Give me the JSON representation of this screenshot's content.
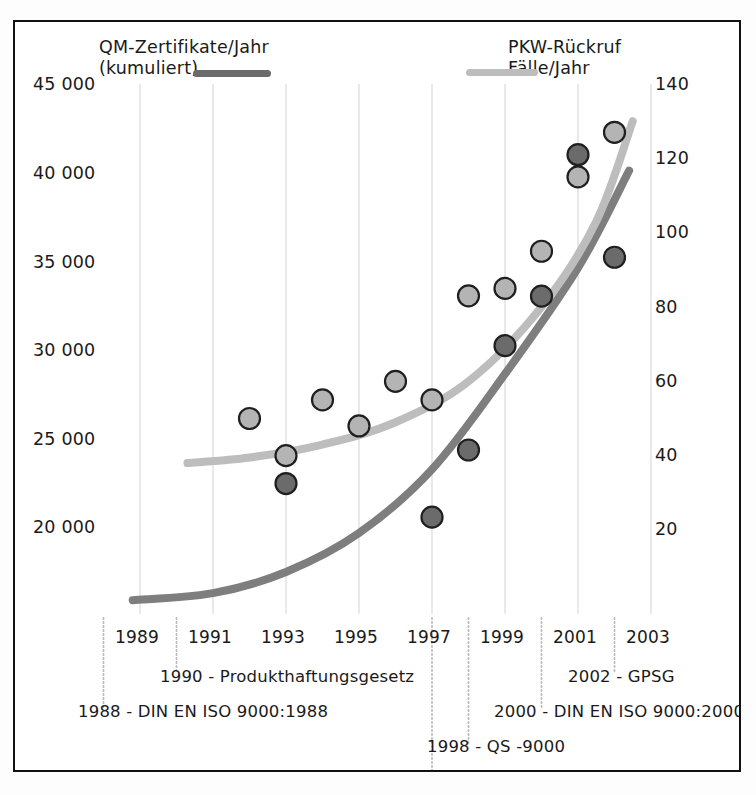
{
  "chart_data": {
    "type": "scatter",
    "title": "",
    "subtitle": "",
    "xlabel": "",
    "ylabel": "QM-Zertifikate/Jahr (kumuliert)",
    "y2label": "PKW-Rückruf Fälle/Jahr",
    "grid": true,
    "legend_position": "top",
    "xlim": [
      1988,
      2003.6
    ],
    "ylim": [
      15000,
      45000
    ],
    "y2lim": [
      0,
      140
    ],
    "xticks": [
      "1989",
      "1991",
      "1993",
      "1995",
      "1997",
      "1999",
      "2001",
      "2003"
    ],
    "xtick_values": [
      1989,
      1991,
      1993,
      1995,
      1997,
      1999,
      2001,
      2003
    ],
    "yticks": [
      "20 000",
      "25 000",
      "30 000",
      "35 000",
      "40 000",
      "45 000"
    ],
    "ytick_values": [
      20000,
      25000,
      30000,
      35000,
      40000,
      45000
    ],
    "y2ticks": [
      "20",
      "40",
      "60",
      "80",
      "100",
      "120",
      "140"
    ],
    "y2tick_values": [
      20,
      40,
      60,
      80,
      100,
      120,
      140
    ],
    "series": [
      {
        "name": "QM-Zertifikate/Jahr (kumuliert)",
        "axis": "left",
        "marker_color": "#6b6b6b",
        "marker_edge": "#1f1f1f",
        "line_color": "#7e7e7e",
        "x": [
          1993,
          1997,
          1998,
          1999,
          2000,
          2001,
          2002
        ],
        "values": [
          22400,
          20500,
          24300,
          30200,
          33000,
          41000,
          35200
        ],
        "trend": [
          [
            1988.8,
            15800
          ],
          [
            1991.0,
            16200
          ],
          [
            1993.0,
            17400
          ],
          [
            1995.0,
            19600
          ],
          [
            1997.0,
            23200
          ],
          [
            1999.0,
            28600
          ],
          [
            2001.0,
            34600
          ],
          [
            2002.4,
            40100
          ]
        ]
      },
      {
        "name": "PKW-Rückruf Fälle/Jahr",
        "axis": "right",
        "marker_color": "#b4b4b4",
        "marker_edge": "#1f1f1f",
        "line_color": "#bdbdbd",
        "x": [
          1992,
          1993,
          1994,
          1995,
          1996,
          1997,
          1998,
          1999,
          2000,
          2001,
          2002
        ],
        "values": [
          50,
          40,
          55,
          48,
          60,
          55,
          83,
          85,
          95,
          115,
          127
        ],
        "trend": [
          [
            1990.3,
            38
          ],
          [
            1992.0,
            39.5
          ],
          [
            1994.0,
            43
          ],
          [
            1996.0,
            49
          ],
          [
            1998.0,
            60
          ],
          [
            2000.0,
            80
          ],
          [
            2001.5,
            103
          ],
          [
            2002.5,
            130
          ]
        ]
      }
    ],
    "annotations": [
      {
        "id": "1988",
        "label": "1988 - DIN EN ISO 9000:1988",
        "year": 1988.0,
        "row": 2,
        "align": "left"
      },
      {
        "id": "1990",
        "label": "1990 - Produkthaftungsgesetz",
        "year": 1990.0,
        "row": 1,
        "align": "left"
      },
      {
        "id": "1997",
        "label": "1997 - Produktsicherheitsgesetz",
        "year": 1997.0,
        "row": 4,
        "align": "right"
      },
      {
        "id": "1998",
        "label": "1998 - QS -9000",
        "year": 1998.0,
        "row": 3,
        "align": "left"
      },
      {
        "id": "2000",
        "label": "2000 - DIN EN ISO 9000:2000",
        "year": 2000.0,
        "row": 2,
        "align": "left"
      },
      {
        "id": "2002",
        "label": "2002 - GPSG",
        "year": 2002.0,
        "row": 1,
        "align": "left"
      }
    ]
  },
  "legend": {
    "left": {
      "line1": "QM-Zertifikate/Jahr",
      "line2": "(kumuliert)",
      "color": "#6b6b6b"
    },
    "right": {
      "line1": "PKW-Rückruf",
      "line2": "Fälle/Jahr",
      "color": "#b9b9b9"
    }
  },
  "axis_left": {
    "t0": "45 000",
    "t1": "40 000",
    "t2": "35 000",
    "t3": "30 000",
    "t4": "25 000",
    "t5": "20 000"
  },
  "axis_right": {
    "t0": "140",
    "t1": "120",
    "t2": "100",
    "t3": "80",
    "t4": "60",
    "t5": "40",
    "t6": "20"
  },
  "axis_x": {
    "t0": "1989",
    "t1": "1991",
    "t2": "1993",
    "t3": "1995",
    "t4": "1997",
    "t5": "1999",
    "t6": "2001",
    "t7": "2003"
  },
  "annotations_text": {
    "a1988": "1988 - DIN EN ISO 9000:1988",
    "a1990": "1990 - Produkthaftungsgesetz",
    "a1997": "1997 - Produktsicherheitsgesetz",
    "a1998": "1998 - QS -9000",
    "a2000": "2000 - DIN EN ISO 9000:2000",
    "a2002": "2002 - GPSG"
  }
}
